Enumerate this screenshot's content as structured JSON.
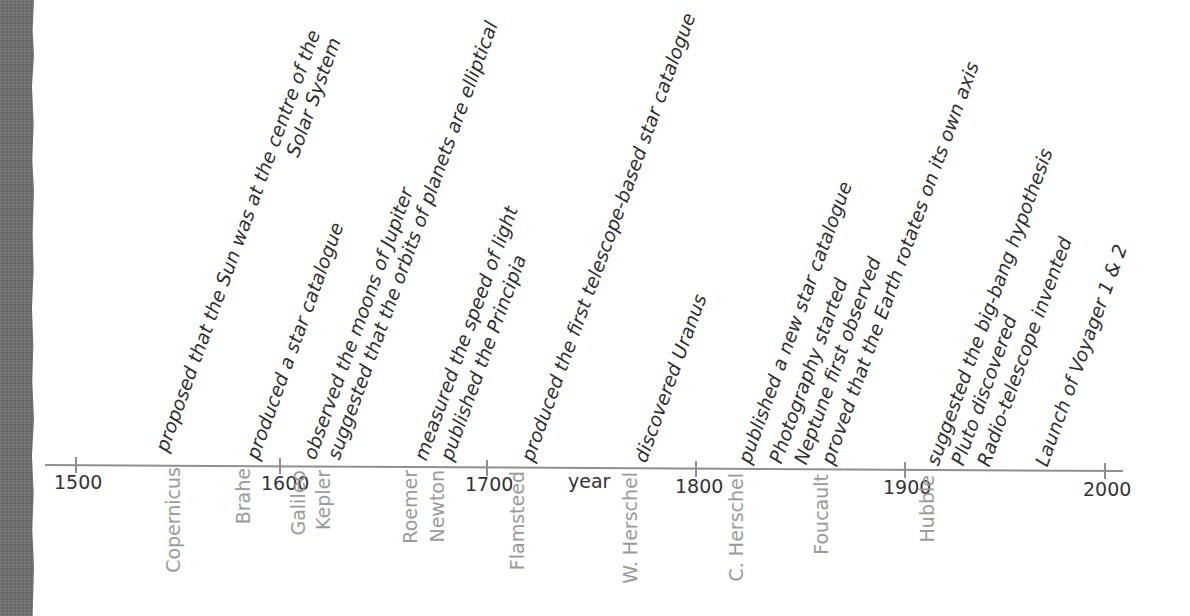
{
  "diagram": {
    "type": "timeline",
    "axis_label": "year",
    "axis_ticks": [
      {
        "label": "1500",
        "x": 76,
        "y": 465
      },
      {
        "label": "1600",
        "x": 280,
        "y": 466
      },
      {
        "label": "1700",
        "x": 487,
        "y": 467
      },
      {
        "label": "1800",
        "x": 696,
        "y": 468
      },
      {
        "label": "1900",
        "x": 905,
        "y": 469
      },
      {
        "label": "2000",
        "x": 1105,
        "y": 470
      }
    ],
    "events": [
      {
        "name": "Copernicus",
        "description": "proposed that the Sun was at the centre of the",
        "description_line2": "Solar System",
        "approx_year": 1543
      },
      {
        "name": "Brahe",
        "description": "produced a star catalogue",
        "approx_year": 1580
      },
      {
        "name": "Galileo",
        "description": "observed the moons of Jupiter",
        "approx_year": 1610
      },
      {
        "name": "Kepler",
        "description": "suggested that the orbits of planets are elliptical",
        "approx_year": 1619
      },
      {
        "name": "Roemer",
        "description": "measured the speed of light",
        "approx_year": 1676
      },
      {
        "name": "Newton",
        "description": "published the Principia",
        "approx_year": 1687
      },
      {
        "name": "Flamsteed",
        "description": "produced the first telescope-based star catalogue",
        "approx_year": 1725
      },
      {
        "name": "W. Herschel",
        "description": "discovered Uranus",
        "approx_year": 1781
      },
      {
        "name": "C. Herschel",
        "description": "published a new star catalogue",
        "approx_year": 1828
      },
      {
        "name": "",
        "description": "Photography started",
        "approx_year": 1839
      },
      {
        "name": "",
        "description": "Neptune first observed",
        "approx_year": 1846
      },
      {
        "name": "Foucault",
        "description": "proved that the Earth rotates on its own axis",
        "approx_year": 1851
      },
      {
        "name": "Hubble",
        "description": "suggested the big-bang hypothesis",
        "approx_year": 1929
      },
      {
        "name": "",
        "description": "Pluto discovered",
        "approx_year": 1930
      },
      {
        "name": "",
        "description": "Radio-telescope invented",
        "approx_year": 1937
      },
      {
        "name": "",
        "description": "Launch of Voyager 1 & 2",
        "approx_year": 1977
      }
    ]
  }
}
